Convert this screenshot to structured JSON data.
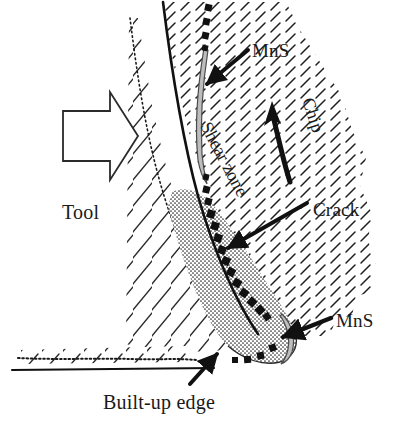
{
  "figure": {
    "type": "technical-line-diagram",
    "background_color": "#ffffff",
    "ink_color": "#1a1a1a",
    "labels": {
      "tool": "Tool",
      "mns_top": "MnS",
      "mns_bottom": "MnS",
      "chip": "Chip",
      "shear_zone": "Shear zone",
      "crack": "Crack",
      "built_up_edge": "Built-up edge"
    },
    "regions": {
      "tool_body": "Tool",
      "chip_body": "Chip",
      "built_up_edge_body": "Built-up edge",
      "workpiece_surface": "Machined surface"
    },
    "annotations": [
      {
        "name": "mns-top",
        "label": "MnS",
        "arrow": "straight",
        "points_to": "thin lens-shaped inclusion inside chip",
        "direction": "down-left"
      },
      {
        "name": "chip",
        "label": "Chip",
        "arrow": "curved",
        "points_to": "chip flow direction",
        "direction": "up",
        "text_rotation_deg": 72
      },
      {
        "name": "shear-zone",
        "label": "Shear zone",
        "arrow": "none",
        "text_rotation_deg": 62
      },
      {
        "name": "crack",
        "label": "Crack",
        "arrow": "straight",
        "points_to": "dotted square crack path",
        "direction": "down-left"
      },
      {
        "name": "mns-bottom",
        "label": "MnS",
        "arrow": "straight",
        "points_to": "crescent inclusion at built-up edge bulge",
        "direction": "left"
      },
      {
        "name": "built-up-edge",
        "label": "Built-up edge",
        "arrow": "straight",
        "points_to": "stippled region at tool tip",
        "direction": "up-left"
      },
      {
        "name": "tool-feed",
        "label": "Tool",
        "arrow": "hollow-block",
        "direction": "right"
      }
    ],
    "fills": {
      "tool_hatch": "sparse long diagonal hatch",
      "chip_hatch": "dense short diagonal hatch",
      "built_up_edge": "stipple / dot fill",
      "mns_inclusion": "#b8b8b8",
      "crack_marks": "#111111"
    }
  }
}
